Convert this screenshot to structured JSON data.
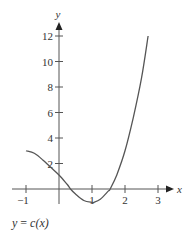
{
  "chart_data": {
    "type": "line",
    "title": "",
    "caption": "y = c(x)",
    "xlabel": "x",
    "ylabel": "y",
    "xlim": [
      -1.1,
      3.4
    ],
    "ylim": [
      -1.5,
      13.5
    ],
    "x_ticks": [
      -1,
      1,
      2,
      3
    ],
    "x_tick_labels": [
      "−1",
      "1",
      "2",
      "3"
    ],
    "y_ticks": [
      2,
      4,
      6,
      8,
      10,
      12
    ],
    "y_tick_labels": [
      "2",
      "4",
      "6",
      "8",
      "10",
      "12"
    ],
    "grid": false,
    "legend": null,
    "series": [
      {
        "name": "c(x)",
        "x": [
          -1,
          -0.75,
          -0.5,
          -0.25,
          0,
          0.25,
          0.35,
          0.5,
          0.75,
          1.0,
          1.05,
          1.25,
          1.5,
          1.55,
          1.75,
          2.0,
          2.25,
          2.5,
          2.7
        ],
        "values": [
          3.0,
          2.8,
          2.3,
          1.7,
          1.1,
          0.35,
          0.0,
          -0.4,
          -0.9,
          -1.05,
          -1.05,
          -0.8,
          -0.15,
          0.0,
          1.1,
          3.0,
          5.6,
          8.7,
          12.0
        ]
      }
    ]
  },
  "labels": {
    "x_axis": "x",
    "y_axis": "y",
    "caption_prefix": "y = ",
    "caption_func": "c(x)"
  }
}
